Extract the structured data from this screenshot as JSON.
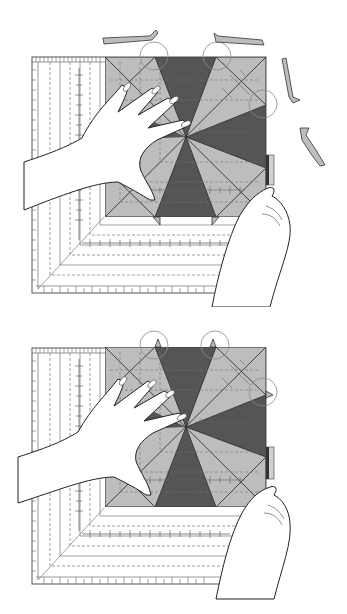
{
  "figure": {
    "colors": {
      "background": "#ffffff",
      "dark_fabric": "#555555",
      "light_fabric": "#bdbdbd",
      "ruler_shade": "#a9a9a9",
      "line": "#333333",
      "circle_highlight": "#8a8a8a"
    },
    "panels": [
      {
        "id": "step-1",
        "caption": "Trim ruler edge; fabric scraps shown cut away",
        "has_trimmed_scraps": true,
        "highlight_circles": 3
      },
      {
        "id": "step-2",
        "caption": "Trimmed block with corners aligned",
        "has_trimmed_scraps": false,
        "highlight_circles": 3
      }
    ]
  }
}
